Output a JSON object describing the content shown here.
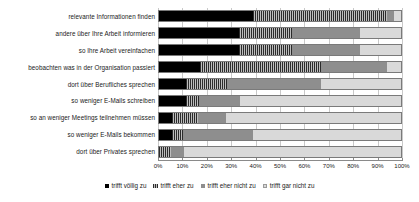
{
  "chart_data": {
    "type": "bar",
    "orientation": "horizontal",
    "stacked": true,
    "normalized": true,
    "title": "",
    "xlabel": "",
    "ylabel": "",
    "xlim": [
      0,
      100
    ],
    "grid": true,
    "legend_position": "bottom",
    "xticks": [
      "0%",
      "10%",
      "20%",
      "30%",
      "40%",
      "50%",
      "60%",
      "70%",
      "80%",
      "90%",
      "100%"
    ],
    "xtick_values": [
      0,
      10,
      20,
      30,
      40,
      50,
      60,
      70,
      80,
      90,
      100
    ],
    "categories": [
      "relevante Informationen finden",
      "andere über Ihre Arbeit informieren",
      "so Ihre Arbeit vereinfachen",
      "beobachten was in der Organisation passiert",
      "dort über Berufliches sprechen",
      "so weniger E-Mails schreiben",
      "so an weniger Meetings teilnehmen müssen",
      "so weniger E-Mails bekommen",
      "dort über Privates sprechen"
    ],
    "series": [
      {
        "name": "trifft völlig zu",
        "color": "#000000",
        "values": [
          39,
          33,
          33,
          17,
          11,
          11,
          5.5,
          5.5,
          0
        ]
      },
      {
        "name": "trifft eher zu",
        "color": "#4a4a4a",
        "values": [
          55,
          22,
          22,
          50,
          17,
          5.5,
          10.5,
          4.5,
          5
        ]
      },
      {
        "name": "trifft eher nicht zu",
        "color": "#8e8e8e",
        "values": [
          3,
          28,
          28,
          27,
          39,
          17,
          11.5,
          29,
          5.5
        ]
      },
      {
        "name": "trifft gar nicht zu",
        "color": "#d9d9d9",
        "values": [
          3,
          17,
          17,
          6,
          33,
          66.5,
          72.5,
          61,
          89.5
        ]
      }
    ]
  }
}
